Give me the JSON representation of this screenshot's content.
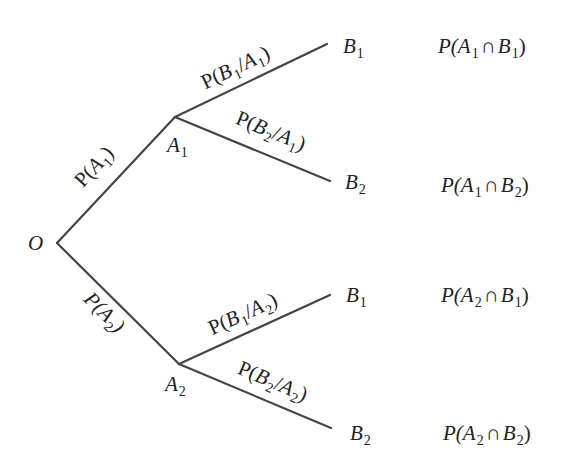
{
  "diagram": {
    "type": "probability-tree",
    "line_color": "#444444",
    "root": {
      "label": "O"
    },
    "first_level": [
      {
        "node": {
          "letter": "A",
          "sub": "1"
        },
        "edge_label": {
          "prefix": "P(",
          "letter": "A",
          "sub": "1",
          "suffix": ")"
        },
        "children": [
          {
            "node": {
              "letter": "B",
              "sub": "1"
            },
            "edge_label": {
              "prefix": "P(",
              "b": "B",
              "bsub": "1",
              "sep": "/",
              "a": "A",
              "asub": "1",
              "suffix": ")"
            },
            "result": {
              "prefix": "P(",
              "a": "A",
              "asub": "1",
              "op": "∩",
              "b": "B",
              "bsub": "1",
              "suffix": ")"
            }
          },
          {
            "node": {
              "letter": "B",
              "sub": "2"
            },
            "edge_label": {
              "prefix": "P(",
              "b": "B",
              "bsub": "2",
              "sep": "/",
              "a": "A",
              "asub": "1",
              "suffix": ")"
            },
            "result": {
              "prefix": "P(",
              "a": "A",
              "asub": "1",
              "op": "∩",
              "b": "B",
              "bsub": "2",
              "suffix": ")"
            }
          }
        ]
      },
      {
        "node": {
          "letter": "A",
          "sub": "2"
        },
        "edge_label": {
          "prefix": "P(",
          "letter": "A",
          "sub": "2",
          "suffix": ")"
        },
        "children": [
          {
            "node": {
              "letter": "B",
              "sub": "1"
            },
            "edge_label": {
              "prefix": "P(",
              "b": "B",
              "bsub": "1",
              "sep": "/",
              "a": "A",
              "asub": "2",
              "suffix": ")"
            },
            "result": {
              "prefix": "P(",
              "a": "A",
              "asub": "2",
              "op": "∩",
              "b": "B",
              "bsub": "1",
              "suffix": ")"
            }
          },
          {
            "node": {
              "letter": "B",
              "sub": "2"
            },
            "edge_label": {
              "prefix": "P(",
              "b": "B",
              "bsub": "2",
              "sep": "/",
              "a": "A",
              "asub": "2",
              "suffix": ")"
            },
            "result": {
              "prefix": "P(",
              "a": "A",
              "asub": "2",
              "op": "∩",
              "b": "B",
              "bsub": "2",
              "suffix": ")"
            }
          }
        ]
      }
    ]
  }
}
